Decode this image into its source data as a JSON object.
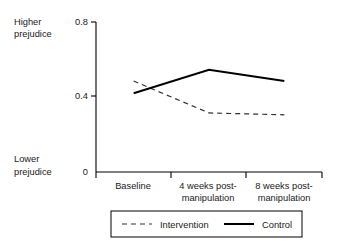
{
  "chart_data": {
    "type": "line",
    "title": "",
    "xlabel": "",
    "ylabel": "",
    "categories": [
      "Baseline",
      "4 weeks post-manipulation",
      "8 weeks post-manipulation"
    ],
    "category_lines": [
      [
        "Baseline"
      ],
      [
        "4 weeks post-",
        "manipulation"
      ],
      [
        "8 weeks post-",
        "manipulation"
      ]
    ],
    "series": [
      {
        "name": "Intervention",
        "style": "dashed",
        "color": "#333333",
        "values": [
          0.485,
          0.315,
          0.305
        ]
      },
      {
        "name": "Control",
        "style": "solid",
        "color": "#000000",
        "values": [
          0.42,
          0.545,
          0.485
        ]
      }
    ],
    "ylim": [
      0,
      0.8
    ],
    "yticks": [
      0,
      0.4,
      0.8
    ],
    "ytick_labels": [
      "0",
      "0.4",
      "0.8"
    ],
    "grid": false,
    "legend_position": "bottom",
    "axis_top_annotation": [
      "Higher",
      "prejudice"
    ],
    "axis_bottom_annotation": [
      "Lower",
      "prejudice"
    ]
  },
  "axis": {
    "y_top_label_line1": "Higher",
    "y_top_label_line2": "prejudice",
    "y_bottom_label_line1": "Lower",
    "y_bottom_label_line2": "prejudice",
    "tick_0": "0",
    "tick_04": "0.4",
    "tick_08": "0.8"
  },
  "categories": {
    "c0_l0": "Baseline",
    "c1_l0": "4 weeks post-",
    "c1_l1": "manipulation",
    "c2_l0": "8 weeks post-",
    "c2_l1": "manipulation"
  },
  "legend": {
    "item0_label": "Intervention",
    "item1_label": "Control"
  }
}
